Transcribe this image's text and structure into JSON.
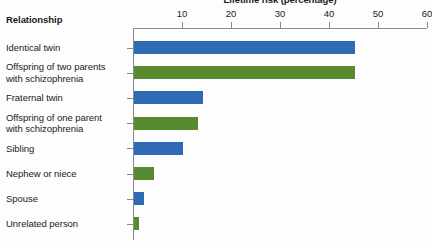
{
  "chart_data": {
    "type": "bar",
    "orientation": "horizontal",
    "title": "Lifetime risk (percentage)",
    "xlabel": "Lifetime risk (percentage)",
    "ylabel": "Relationship",
    "xlim": [
      0,
      60
    ],
    "xticks": [
      10,
      20,
      30,
      40,
      50,
      60
    ],
    "xtick_labels": [
      "10",
      "20",
      "30",
      "40",
      "50",
      "60"
    ],
    "grid": false,
    "legend": "none",
    "categories": [
      "Identical twin",
      "Offspring of two parents\nwith schizophrenia",
      "Fraternal twin",
      "Offspring of one parent\nwith schizophrenia",
      "Sibling",
      "Nephew or niece",
      "Spouse",
      "Unrelated person"
    ],
    "values": [
      45,
      45,
      14,
      13,
      10,
      4,
      2,
      1
    ],
    "bar_colors": [
      "#2f6bb5",
      "#5a8a30",
      "#2f6bb5",
      "#5a8a30",
      "#2f6bb5",
      "#5a8a30",
      "#2f6bb5",
      "#5a8a30"
    ],
    "colors": {
      "blue": "#2f6bb5",
      "green": "#5a8a30",
      "axis": "#8b8b8b",
      "text": "#1b1b1b",
      "background": "#fdfdfd"
    }
  },
  "rows": [
    {
      "label": "Identical twin",
      "value": 45,
      "color_class": "blue"
    },
    {
      "label": "Offspring of two parents\nwith schizophrenia",
      "value": 45,
      "color_class": "green"
    },
    {
      "label": "Fraternal twin",
      "value": 14,
      "color_class": "blue"
    },
    {
      "label": "Offspring of one parent\nwith schizophrenia",
      "value": 13,
      "color_class": "green"
    },
    {
      "label": "Sibling",
      "value": 10,
      "color_class": "blue"
    },
    {
      "label": "Nephew or niece",
      "value": 4,
      "color_class": "green"
    },
    {
      "label": "Spouse",
      "value": 2,
      "color_class": "blue"
    },
    {
      "label": "Unrelated person",
      "value": 1,
      "color_class": "green"
    }
  ]
}
